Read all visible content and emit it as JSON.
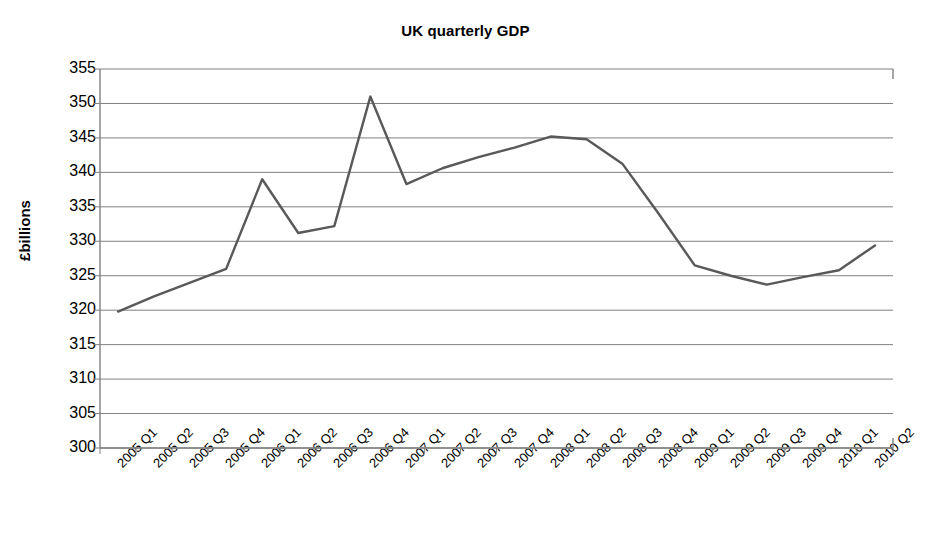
{
  "chart_data": {
    "type": "line",
    "title": "UK quarterly GDP",
    "xlabel": "",
    "ylabel": "£billions",
    "ylim": [
      300,
      355
    ],
    "ytick_step": 5,
    "yticks": [
      355,
      350,
      345,
      340,
      335,
      330,
      325,
      320,
      315,
      310,
      305,
      300
    ],
    "grid": "horizontal",
    "legend": "none",
    "line_color": "#595959",
    "categories": [
      "2005 Q1",
      "2005 Q2",
      "2005 Q3",
      "2005 Q4",
      "2006 Q1",
      "2006 Q2",
      "2006 Q3",
      "2006 Q4",
      "2007 Q1",
      "2007 Q2",
      "2007 Q3",
      "2007 Q4",
      "2008 Q1",
      "2008 Q2",
      "2008 Q3",
      "2008 Q4",
      "2009 Q1",
      "2009 Q2",
      "2009 Q3",
      "2009 Q4",
      "2010 Q1",
      "2010 Q2"
    ],
    "values": [
      319.8,
      322.0,
      324.0,
      326.0,
      339.0,
      331.2,
      332.2,
      351.0,
      338.3,
      340.6,
      342.2,
      343.6,
      345.2,
      344.8,
      341.2,
      334.0,
      326.5,
      325.0,
      323.7,
      324.8,
      325.8,
      329.4
    ]
  }
}
